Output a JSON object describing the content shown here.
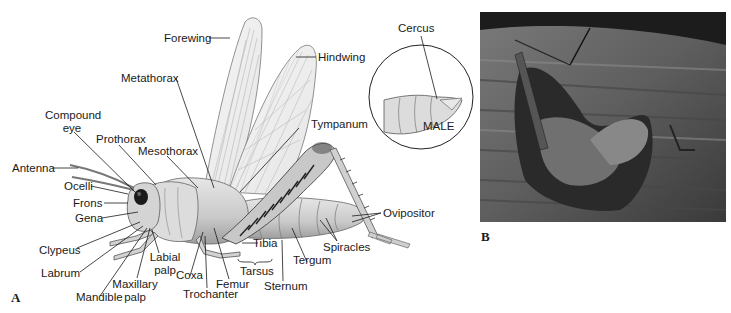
{
  "figure": {
    "panel_a": {
      "letter": "A",
      "labels": {
        "forewing": "Forewing",
        "hindwing": "Hindwing",
        "metathorax": "Metathorax",
        "compound_eye_1": "Compound",
        "compound_eye_2": "eye",
        "prothorax": "Prothorax",
        "mesothorax": "Mesothorax",
        "tympanum": "Tympanum",
        "antenna": "Antenna",
        "ocelli": "Ocelli",
        "frons": "Frons",
        "gena": "Gena",
        "clypeus": "Clypeus",
        "labrum": "Labrum",
        "mandible": "Mandible",
        "maxillary_palp_1": "Maxillary",
        "maxillary_palp_2": "palp",
        "labial_palp_1": "Labial",
        "labial_palp_2": "palp",
        "coxa": "Coxa",
        "trochanter": "Trochanter",
        "femur": "Femur",
        "tibia": "Tibia",
        "tarsus": "Tarsus",
        "sternum": "Sternum",
        "tergum": "Tergum",
        "spiracles": "Spiracles",
        "ovipositor": "Ovipositor"
      },
      "inset": {
        "label_cercus": "Cercus",
        "caption": "MALE"
      }
    },
    "panel_b": {
      "letter": "B",
      "description": "Photograph of mating grasshoppers on wood"
    }
  }
}
